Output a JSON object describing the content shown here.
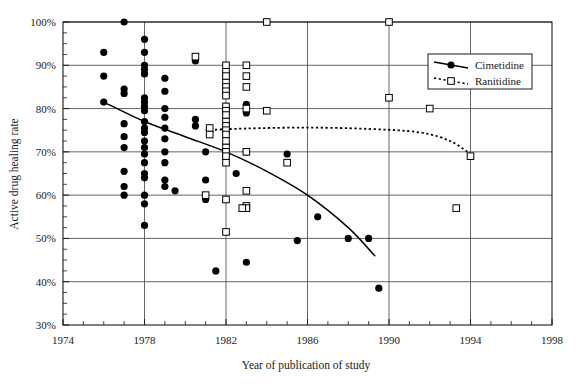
{
  "chart_data": {
    "type": "scatter",
    "title": "",
    "xlabel": "Year of publication of study",
    "ylabel": "Active drug healing rate",
    "xlim": [
      1974,
      1998
    ],
    "ylim": [
      30,
      100
    ],
    "xticks": [
      1974,
      1978,
      1982,
      1986,
      1990,
      1994,
      1998
    ],
    "xtick_labels": [
      "1974",
      "1978",
      "1982",
      "1986",
      "1990",
      "1994",
      "1998"
    ],
    "yticks": [
      30,
      40,
      50,
      60,
      70,
      80,
      90,
      100
    ],
    "ytick_labels": [
      "30%",
      "40%",
      "50%",
      "60%",
      "70%",
      "80%",
      "90%",
      "100%"
    ],
    "x_minor_tick_step": 1,
    "y_minor_tick_step": 2.5,
    "grid": true,
    "grid_axes": "both",
    "legend_position": "top-right",
    "series": [
      {
        "name": "Cimetidine",
        "marker": "filled-circle",
        "marker_color": "#000000",
        "line_style": "solid",
        "points": [
          [
            1976.0,
            93.0
          ],
          [
            1976.0,
            87.5
          ],
          [
            1976.0,
            81.5
          ],
          [
            1977.0,
            100.0
          ],
          [
            1977.0,
            84.5
          ],
          [
            1977.0,
            83.5
          ],
          [
            1977.0,
            76.5
          ],
          [
            1977.0,
            73.5
          ],
          [
            1977.0,
            71.0
          ],
          [
            1977.0,
            65.5
          ],
          [
            1977.0,
            62.0
          ],
          [
            1977.0,
            60.0
          ],
          [
            1978.0,
            96.0
          ],
          [
            1978.0,
            93.0
          ],
          [
            1978.0,
            90.0
          ],
          [
            1978.0,
            89.0
          ],
          [
            1978.0,
            88.0
          ],
          [
            1978.0,
            82.5
          ],
          [
            1978.0,
            81.5
          ],
          [
            1978.0,
            80.5
          ],
          [
            1978.0,
            79.5
          ],
          [
            1978.0,
            77.0
          ],
          [
            1978.0,
            75.5
          ],
          [
            1978.0,
            74.5
          ],
          [
            1978.0,
            72.5
          ],
          [
            1978.0,
            71.0
          ],
          [
            1978.0,
            69.5
          ],
          [
            1978.0,
            67.5
          ],
          [
            1978.0,
            65.0
          ],
          [
            1978.0,
            64.0
          ],
          [
            1978.0,
            60.0
          ],
          [
            1978.0,
            58.0
          ],
          [
            1978.0,
            53.0
          ],
          [
            1979.0,
            87.0
          ],
          [
            1979.0,
            84.0
          ],
          [
            1979.0,
            80.0
          ],
          [
            1979.0,
            78.0
          ],
          [
            1979.0,
            75.5
          ],
          [
            1979.0,
            73.0
          ],
          [
            1979.0,
            70.0
          ],
          [
            1979.0,
            67.5
          ],
          [
            1979.0,
            63.5
          ],
          [
            1979.0,
            62.0
          ],
          [
            1979.5,
            61.0
          ],
          [
            1980.5,
            91.0
          ],
          [
            1980.5,
            77.5
          ],
          [
            1980.5,
            76.0
          ],
          [
            1981.0,
            63.5
          ],
          [
            1981.0,
            59.0
          ],
          [
            1981.0,
            70.0
          ],
          [
            1981.5,
            42.5
          ],
          [
            1982.0,
            88.5
          ],
          [
            1982.0,
            87.5
          ],
          [
            1982.0,
            80.5
          ],
          [
            1982.0,
            79.5
          ],
          [
            1982.0,
            74.5
          ],
          [
            1982.0,
            70.0
          ],
          [
            1982.0,
            69.0
          ],
          [
            1982.5,
            65.0
          ],
          [
            1983.0,
            81.0
          ],
          [
            1983.0,
            80.0
          ],
          [
            1983.0,
            79.0
          ],
          [
            1983.0,
            70.0
          ],
          [
            1983.0,
            44.5
          ],
          [
            1985.0,
            69.5
          ],
          [
            1985.5,
            49.5
          ],
          [
            1986.5,
            55.0
          ],
          [
            1988.0,
            50.0
          ],
          [
            1989.0,
            50.0
          ],
          [
            1989.5,
            38.5
          ]
        ],
        "trend_line": [
          [
            1976.0,
            81.5
          ],
          [
            1978.0,
            77.0
          ],
          [
            1980.0,
            73.5
          ],
          [
            1982.0,
            70.0
          ],
          [
            1984.0,
            65.5
          ],
          [
            1986.0,
            60.0
          ],
          [
            1988.0,
            52.5
          ],
          [
            1989.3,
            46.0
          ]
        ]
      },
      {
        "name": "Ranitidine",
        "marker": "open-square",
        "marker_color": "#000000",
        "line_style": "dotted",
        "points": [
          [
            1980.5,
            92.0
          ],
          [
            1982.0,
            90.0
          ],
          [
            1982.0,
            88.5
          ],
          [
            1982.0,
            87.5
          ],
          [
            1982.0,
            86.0
          ],
          [
            1982.0,
            85.0
          ],
          [
            1982.0,
            84.0
          ],
          [
            1982.0,
            83.0
          ],
          [
            1982.0,
            80.5
          ],
          [
            1982.0,
            79.5
          ],
          [
            1982.0,
            78.5
          ],
          [
            1982.0,
            77.0
          ],
          [
            1982.0,
            76.0
          ],
          [
            1982.0,
            75.0
          ],
          [
            1982.0,
            74.0
          ],
          [
            1982.0,
            72.5
          ],
          [
            1982.0,
            71.0
          ],
          [
            1982.0,
            70.0
          ],
          [
            1982.0,
            69.0
          ],
          [
            1982.0,
            67.5
          ],
          [
            1982.0,
            59.0
          ],
          [
            1982.0,
            51.5
          ],
          [
            1981.2,
            75.5
          ],
          [
            1981.2,
            74.0
          ],
          [
            1981.0,
            60.0
          ],
          [
            1983.0,
            90.0
          ],
          [
            1983.0,
            87.5
          ],
          [
            1983.0,
            85.0
          ],
          [
            1983.0,
            80.0
          ],
          [
            1983.0,
            70.0
          ],
          [
            1983.0,
            61.0
          ],
          [
            1983.0,
            57.5
          ],
          [
            1983.0,
            57.0
          ],
          [
            1982.8,
            57.0
          ],
          [
            1984.0,
            100.0
          ],
          [
            1984.0,
            79.5
          ],
          [
            1985.0,
            67.5
          ],
          [
            1990.0,
            100.0
          ],
          [
            1990.0,
            82.5
          ],
          [
            1992.0,
            80.0
          ],
          [
            1993.3,
            57.0
          ],
          [
            1994.0,
            69.0
          ]
        ],
        "trend_line": [
          [
            1981.0,
            75.0
          ],
          [
            1983.0,
            75.4
          ],
          [
            1986.0,
            75.6
          ],
          [
            1989.0,
            75.3
          ],
          [
            1991.5,
            74.5
          ],
          [
            1993.0,
            72.5
          ],
          [
            1994.0,
            69.5
          ]
        ]
      }
    ]
  },
  "legend": {
    "items": [
      {
        "label": "Cimetidine",
        "marker": "filled-circle",
        "line": "solid"
      },
      {
        "label": "Ranitidine",
        "marker": "open-square",
        "line": "dotted"
      }
    ]
  },
  "colors": {
    "axis": "#1a1a1a",
    "grid": "#555555",
    "marker": "#000000",
    "background": "#ffffff"
  }
}
